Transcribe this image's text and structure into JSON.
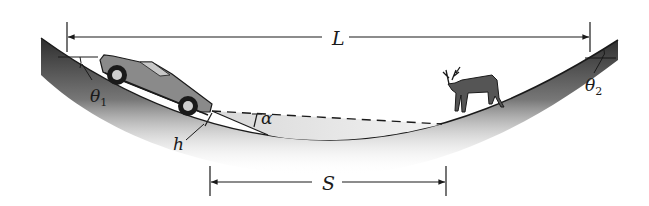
{
  "diagram": {
    "labels": {
      "L": "L",
      "S": "S",
      "h": "h",
      "alpha": "α",
      "theta1": "θ",
      "theta1_sub": "1",
      "theta2": "θ",
      "theta2_sub": "2"
    },
    "elements": {
      "car": "car",
      "deer": "deer",
      "road_curve": "sag curve",
      "headlight_beam": "headlight beam line"
    },
    "colors": {
      "ground_dark": "#3a3a3a",
      "ground_light": "#ffffff",
      "beam_fill": "#e6e6e6",
      "line": "#1a1a1a"
    }
  }
}
